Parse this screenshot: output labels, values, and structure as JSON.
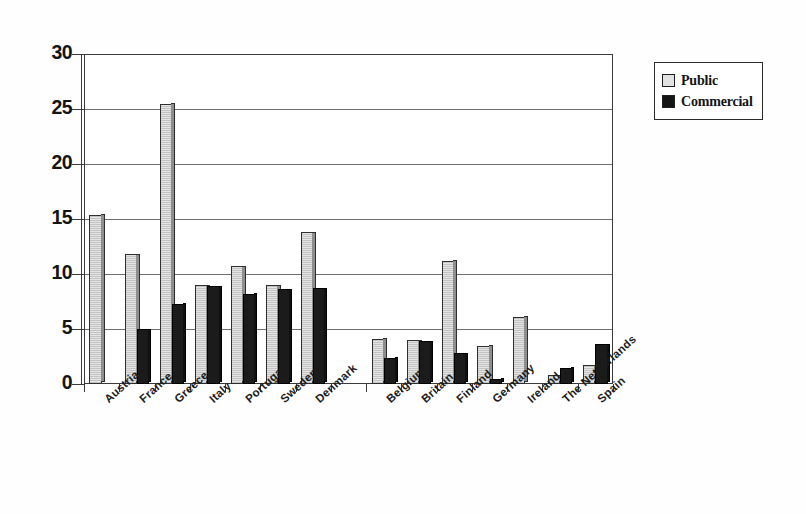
{
  "chart_data": {
    "type": "bar",
    "title": "",
    "xlabel": "",
    "ylabel": "",
    "ylim": [
      0,
      30
    ],
    "yticks": [
      0,
      5,
      10,
      15,
      20,
      25,
      30
    ],
    "grid": true,
    "legend_position": "right",
    "categories": [
      "Austria",
      "France",
      "Greece",
      "Italy",
      "Portugal",
      "Sweden",
      "Denmark",
      "",
      "Belgium",
      "Britain",
      "Finland",
      "Germany",
      "Ireland",
      "The Netherlands",
      "Spain"
    ],
    "series": [
      {
        "name": "Public",
        "color": "#e2e2e2",
        "values": [
          15.4,
          11.8,
          25.5,
          9.0,
          10.7,
          9.0,
          13.8,
          0,
          4.1,
          4.0,
          11.2,
          3.5,
          6.1,
          0.8,
          1.7
        ]
      },
      {
        "name": "Commercial",
        "color": "#141414",
        "values": [
          0,
          5.0,
          7.3,
          8.9,
          8.2,
          8.6,
          8.7,
          0,
          2.4,
          3.9,
          2.8,
          0.5,
          0,
          1.5,
          3.6
        ]
      }
    ]
  },
  "legend": {
    "items": [
      {
        "label": "Public",
        "swatch": "public-swatch"
      },
      {
        "label": "Commercial",
        "swatch": "commercial-swatch"
      }
    ]
  },
  "axis": {
    "y_tick_labels": [
      "30",
      "25",
      "20",
      "15",
      "10",
      "5",
      "0"
    ]
  }
}
